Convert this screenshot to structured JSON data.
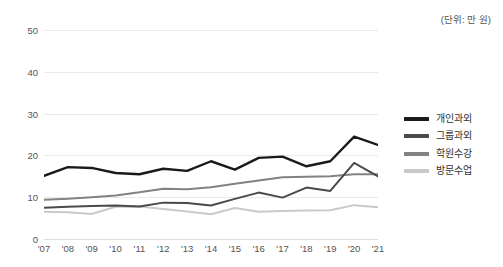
{
  "unit_note": "(단위: 만 원)",
  "legend": {
    "position": "right",
    "items": [
      {
        "label": "개인과외",
        "color": "#1a1a1a"
      },
      {
        "label": "그룹과외",
        "color": "#4a4a4a"
      },
      {
        "label": "학원수강",
        "color": "#828282"
      },
      {
        "label": "방문수업",
        "color": "#c9c9c9"
      }
    ]
  },
  "chart_data": {
    "type": "line",
    "title": "",
    "subtitle": "",
    "xlabel": "",
    "ylabel": "",
    "unit": "(단위: 만 원)",
    "grid": true,
    "legend_position": "right",
    "ylim": [
      0,
      50
    ],
    "yticks": [
      0,
      10,
      20,
      30,
      40,
      50
    ],
    "ytick_labels": [
      "0",
      "10",
      "20",
      "30",
      "40",
      "50"
    ],
    "x": [
      "'07",
      "'08",
      "'09",
      "'10",
      "'11",
      "'12",
      "'13",
      "'14",
      "'15",
      "'16",
      "'17",
      "'18",
      "'19",
      "'20",
      "'21"
    ],
    "categories": [
      "'07",
      "'08",
      "'09",
      "'10",
      "'11",
      "'12",
      "'13",
      "'14",
      "'15",
      "'16",
      "'17",
      "'18",
      "'19",
      "'20",
      "'21"
    ],
    "series": [
      {
        "name": "개인과외",
        "color": "#1a1a1a",
        "width": 2.4,
        "values": [
          15.1,
          17.2,
          17.0,
          15.8,
          15.5,
          16.8,
          16.3,
          18.6,
          16.6,
          19.4,
          19.7,
          17.4,
          18.6,
          24.5,
          22.5
        ]
      },
      {
        "name": "그룹과외",
        "color": "#4a4a4a",
        "width": 2.0,
        "values": [
          7.5,
          7.7,
          7.9,
          8.0,
          7.8,
          8.7,
          8.6,
          8.0,
          9.6,
          11.1,
          9.9,
          12.3,
          11.5,
          18.2,
          15.0
        ]
      },
      {
        "name": "학원수강",
        "color": "#828282",
        "width": 2.0,
        "values": [
          9.4,
          9.6,
          10.0,
          10.4,
          11.2,
          12.0,
          11.9,
          12.4,
          13.2,
          14.0,
          14.8,
          14.9,
          15.0,
          15.5,
          15.5
        ]
      },
      {
        "name": "방문수업",
        "color": "#c9c9c9",
        "width": 2.0,
        "values": [
          6.5,
          6.4,
          6.0,
          7.7,
          7.8,
          7.2,
          6.6,
          5.9,
          7.4,
          6.5,
          6.7,
          6.8,
          6.9,
          8.1,
          7.6
        ]
      }
    ]
  }
}
